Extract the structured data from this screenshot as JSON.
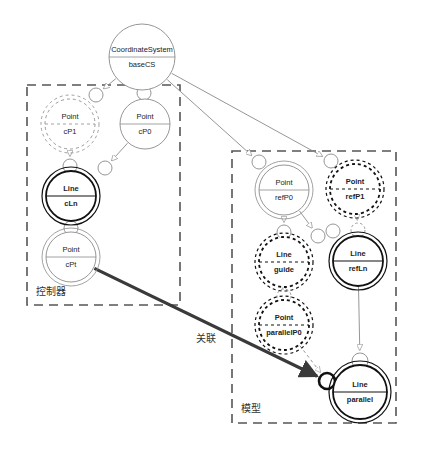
{
  "diagram": {
    "type": "uml-component-diagram",
    "width": 427,
    "height": 466,
    "background": "#ffffff",
    "line_color": "#8a8a8a",
    "bold_line_color": "#111111",
    "frame_color": "#555555",
    "assoc_color": "#3a3a3a"
  },
  "frames": [
    {
      "id": "controller",
      "label": "控制器",
      "x": 27,
      "y": 85,
      "w": 153,
      "h": 220,
      "label_x": 36,
      "label_y": 283
    },
    {
      "id": "model",
      "label": "模型",
      "x": 232,
      "y": 151,
      "w": 164,
      "h": 272,
      "label_x": 241,
      "label_y": 400
    }
  ],
  "nodes": [
    {
      "id": "baseCS",
      "type": "CoordinateSystem",
      "name": "baseCS",
      "cx": 142,
      "cy": 57,
      "r": 33,
      "style": "single",
      "dashed": false,
      "bold_text": false
    },
    {
      "id": "cP1",
      "type": "Point",
      "name": "cP1",
      "cx": 70,
      "cy": 124,
      "r": 25,
      "style": "double",
      "dashed": true,
      "bold_text": false
    },
    {
      "id": "cP0",
      "type": "Point",
      "name": "cP0",
      "cx": 145,
      "cy": 124,
      "r": 25,
      "style": "single",
      "dashed": false,
      "bold_text": false
    },
    {
      "id": "cLn",
      "type": "Line",
      "name": "cLn",
      "cx": 71,
      "cy": 196,
      "r": 25,
      "style": "double",
      "dashed": false,
      "bold_text": true
    },
    {
      "id": "cPt",
      "type": "Point",
      "name": "cPt",
      "cx": 71,
      "cy": 257,
      "r": 25,
      "style": "double",
      "dashed": false,
      "bold_text": false
    },
    {
      "id": "refP0",
      "type": "Point",
      "name": "refP0",
      "cx": 284,
      "cy": 190,
      "r": 25,
      "style": "double",
      "dashed": false,
      "bold_text": false
    },
    {
      "id": "refP1",
      "type": "Point",
      "name": "refP1",
      "cx": 355,
      "cy": 189,
      "r": 25,
      "style": "double",
      "dashed": true,
      "bold_text": true
    },
    {
      "id": "guide",
      "type": "Line",
      "name": "guide",
      "cx": 284,
      "cy": 262,
      "r": 25,
      "style": "double",
      "dashed": true,
      "bold_text": true
    },
    {
      "id": "refLn",
      "type": "Line",
      "name": "refLn",
      "cx": 358,
      "cy": 261,
      "r": 25,
      "style": "double",
      "dashed": false,
      "bold_text": true
    },
    {
      "id": "parallelP0",
      "type": "Point",
      "name": "parallelP0",
      "cx": 284,
      "cy": 325,
      "r": 25,
      "style": "double",
      "dashed": true,
      "bold_text": true
    },
    {
      "id": "parallel",
      "type": "Line",
      "name": "parallel",
      "cx": 360,
      "cy": 392,
      "r": 27,
      "style": "double",
      "dashed": false,
      "bold_text": true
    }
  ],
  "sockets": [
    {
      "id": "s-cP1",
      "cx": 96,
      "cy": 95,
      "r": 7,
      "bold": false,
      "dashed": false
    },
    {
      "id": "s-cP0",
      "cx": 144,
      "cy": 93,
      "r": 7,
      "bold": false,
      "dashed": false
    },
    {
      "id": "s-cLn-a",
      "cx": 70,
      "cy": 166,
      "r": 7,
      "bold": false,
      "dashed": false
    },
    {
      "id": "s-cLn-b",
      "cx": 105,
      "cy": 168,
      "r": 7,
      "bold": false,
      "dashed": false
    },
    {
      "id": "s-cPt",
      "cx": 71,
      "cy": 228,
      "r": 7,
      "bold": false,
      "dashed": false
    },
    {
      "id": "s-refP0",
      "cx": 259,
      "cy": 162,
      "r": 7,
      "bold": false,
      "dashed": false
    },
    {
      "id": "s-refP1",
      "cx": 331,
      "cy": 161,
      "r": 7,
      "bold": false,
      "dashed": false
    },
    {
      "id": "s-guide",
      "cx": 284,
      "cy": 232,
      "r": 7,
      "bold": false,
      "dashed": false
    },
    {
      "id": "s-guide-b",
      "cx": 318,
      "cy": 236,
      "r": 7,
      "bold": false,
      "dashed": false
    },
    {
      "id": "s-refLn",
      "cx": 358,
      "cy": 230,
      "r": 7,
      "bold": false,
      "dashed": true
    },
    {
      "id": "s-refLn-side",
      "cx": 333,
      "cy": 231,
      "r": 7,
      "bold": false,
      "dashed": false
    },
    {
      "id": "s-parallelP0",
      "cx": 284,
      "cy": 296,
      "r": 7,
      "bold": false,
      "dashed": true
    },
    {
      "id": "s-parallel",
      "cx": 360,
      "cy": 361,
      "r": 8,
      "bold": false,
      "dashed": false
    },
    {
      "id": "s-assoc",
      "cx": 327,
      "cy": 381,
      "r": 8,
      "bold": true,
      "dashed": false
    }
  ],
  "edges": [
    {
      "id": "e-baseCS-cP1",
      "from": "baseCS",
      "to": "s-cP1",
      "kind": "thin-solid",
      "arrow": "hollow"
    },
    {
      "id": "e-baseCS-cP0",
      "from": "baseCS",
      "to": "s-cP0",
      "kind": "thin-solid",
      "arrow": "hollow"
    },
    {
      "id": "e-baseCS-refP0",
      "from": "baseCS",
      "to": "s-refP0",
      "kind": "thin-solid",
      "arrow": "hollow"
    },
    {
      "id": "e-baseCS-refP1",
      "from": "baseCS",
      "to": "s-refP1",
      "kind": "thin-solid",
      "arrow": "hollow"
    },
    {
      "id": "e-cP1-cLn",
      "from": "cP1",
      "to": "s-cLn-a",
      "kind": "thin-solid",
      "arrow": "hollow"
    },
    {
      "id": "e-cP0-cLn",
      "from": "cP0",
      "to": "s-cLn-b",
      "kind": "thin-solid",
      "arrow": "hollow"
    },
    {
      "id": "e-cLn-cPt",
      "from": "cLn",
      "to": "s-cPt",
      "kind": "thin-solid",
      "arrow": "hollow"
    },
    {
      "id": "e-refP0-guide",
      "from": "refP0",
      "to": "s-guide",
      "kind": "thin-solid",
      "arrow": "hollow"
    },
    {
      "id": "e-refP0-refLn",
      "from": "refP0",
      "to": "s-guide-b",
      "kind": "thin-solid",
      "arrow": "hollow"
    },
    {
      "id": "e-refP1-refLn",
      "from": "refP1",
      "to": "s-refLn",
      "kind": "thin-dashed",
      "arrow": "hollow"
    },
    {
      "id": "e-guide-parP0",
      "from": "guide",
      "to": "s-parallelP0",
      "kind": "thin-dashed",
      "arrow": "hollow"
    },
    {
      "id": "e-parP0-parallel",
      "from": "parallelP0",
      "to": "s-assoc",
      "kind": "thin-dashed",
      "arrow": "hollow"
    },
    {
      "id": "e-refLn-parallel",
      "from": "refLn",
      "to": "s-parallel",
      "kind": "thin-solid",
      "arrow": "hollow"
    },
    {
      "id": "e-assoc",
      "from": "cPt",
      "to": "s-assoc",
      "kind": "thick-solid",
      "arrow": "filled",
      "label": "关联",
      "label_x": 196,
      "label_y": 330
    }
  ]
}
